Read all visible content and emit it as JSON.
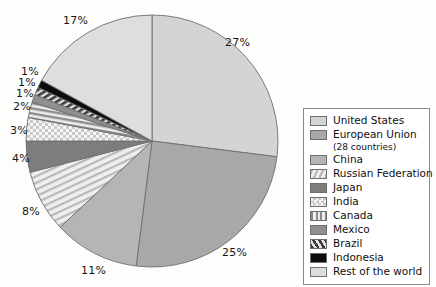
{
  "chart_data": {
    "type": "pie",
    "title": "",
    "subtitle": "",
    "xlabel": "",
    "ylabel": "",
    "legend_position": "right",
    "grid": false,
    "start_angle_deg": 0,
    "direction": "clockwise",
    "units": "percent",
    "categories": [
      "United States",
      "European Union (28 countries)",
      "China",
      "Russian Federation",
      "Japan",
      "India",
      "Canada",
      "Mexico",
      "Brazil",
      "Indonesia",
      "Rest of the world"
    ],
    "values": [
      27,
      25,
      11,
      8,
      4,
      3,
      2,
      1,
      1,
      1,
      17
    ],
    "data_labels": [
      "27%",
      "25%",
      "11%",
      "8%",
      "4%",
      "3%",
      "2%",
      "1%",
      "1%",
      "1%",
      "17%"
    ],
    "slices": [
      {
        "label": "United States",
        "value": 27,
        "data_label": "27%",
        "fill": "#d4d4d4",
        "pattern": "solid"
      },
      {
        "label": "European Union",
        "value": 25,
        "data_label": "25%",
        "fill": "#a8a8a8",
        "pattern": "solid"
      },
      {
        "label": "China",
        "value": 11,
        "data_label": "11%",
        "fill": "#b5b5b5",
        "pattern": "solid"
      },
      {
        "label": "Russian Federation",
        "value": 8,
        "data_label": "8%",
        "fill": "#e6e6e6",
        "pattern": "diagonal-stripe-light"
      },
      {
        "label": "Japan",
        "value": 4,
        "data_label": "4%",
        "fill": "#7d7d7d",
        "pattern": "solid"
      },
      {
        "label": "India",
        "value": 3,
        "data_label": "3%",
        "fill": "#f2f2f2",
        "pattern": "checker-dots"
      },
      {
        "label": "Canada",
        "value": 2,
        "data_label": "2%",
        "fill": "#cfcfcf",
        "pattern": "vertical-stripe"
      },
      {
        "label": "Mexico",
        "value": 1,
        "data_label": "1%",
        "fill": "#8f8f8f",
        "pattern": "solid"
      },
      {
        "label": "Brazil",
        "value": 1,
        "data_label": "1%",
        "fill": "#c4c4c4",
        "pattern": "diagonal-stripe-bold"
      },
      {
        "label": "Indonesia",
        "value": 1,
        "data_label": "1%",
        "fill": "#0d0d0d",
        "pattern": "solid"
      },
      {
        "label": "Rest of the world",
        "value": 17,
        "data_label": "17%",
        "fill": "#dedede",
        "pattern": "solid"
      }
    ]
  },
  "legend": {
    "items": [
      {
        "label": "United States",
        "sublabel": "",
        "swatch": "swatch-united-states"
      },
      {
        "label": "European Union",
        "sublabel": "(28 countries)",
        "swatch": "swatch-european-union"
      },
      {
        "label": "China",
        "sublabel": "",
        "swatch": "swatch-china"
      },
      {
        "label": "Russian Federation",
        "sublabel": "",
        "swatch": "swatch-russian-federation"
      },
      {
        "label": "Japan",
        "sublabel": "",
        "swatch": "swatch-japan"
      },
      {
        "label": "India",
        "sublabel": "",
        "swatch": "swatch-india"
      },
      {
        "label": "Canada",
        "sublabel": "",
        "swatch": "swatch-canada"
      },
      {
        "label": "Mexico",
        "sublabel": "",
        "swatch": "swatch-mexico"
      },
      {
        "label": "Brazil",
        "sublabel": "",
        "swatch": "swatch-brazil"
      },
      {
        "label": "Indonesia",
        "sublabel": "",
        "swatch": "swatch-indonesia"
      },
      {
        "label": "Rest of the world",
        "sublabel": "",
        "swatch": "swatch-rest-of-the-world"
      }
    ]
  },
  "colors": {
    "united_states": "#d4d4d4",
    "european_union": "#a8a8a8",
    "china": "#b5b5b5",
    "russian_federation": "#e6e6e6",
    "japan": "#7d7d7d",
    "india": "#f2f2f2",
    "canada": "#cfcfcf",
    "mexico": "#8f8f8f",
    "brazil": "#c4c4c4",
    "indonesia": "#0d0d0d",
    "rest_of_the_world": "#dedede",
    "outline": "#6e6e6e",
    "label_text": "#161616",
    "page_background": "#fdfdfc"
  }
}
